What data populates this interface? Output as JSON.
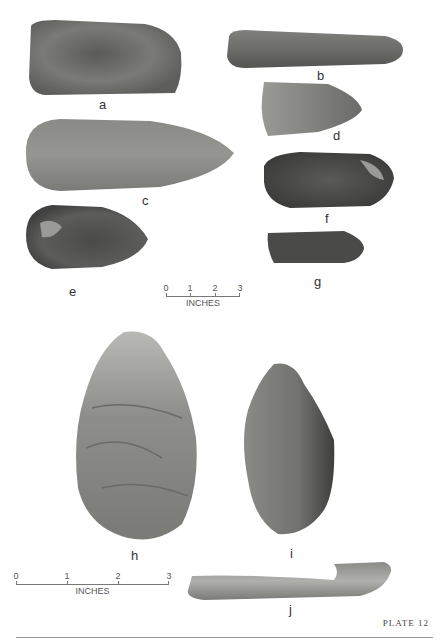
{
  "plate": {
    "label": "PLATE 12"
  },
  "artifacts": [
    {
      "id": "a",
      "label": "a"
    },
    {
      "id": "b",
      "label": "b"
    },
    {
      "id": "c",
      "label": "c"
    },
    {
      "id": "d",
      "label": "d"
    },
    {
      "id": "e",
      "label": "e"
    },
    {
      "id": "f",
      "label": "f"
    },
    {
      "id": "g",
      "label": "g"
    },
    {
      "id": "h",
      "label": "h"
    },
    {
      "id": "i",
      "label": "i"
    },
    {
      "id": "j",
      "label": "j"
    }
  ],
  "scales": [
    {
      "ticks": [
        "0",
        "1",
        "2",
        "3"
      ],
      "unit": "INCHES"
    },
    {
      "ticks": [
        "0",
        "1",
        "2",
        "3"
      ],
      "unit": "INCHES"
    }
  ]
}
